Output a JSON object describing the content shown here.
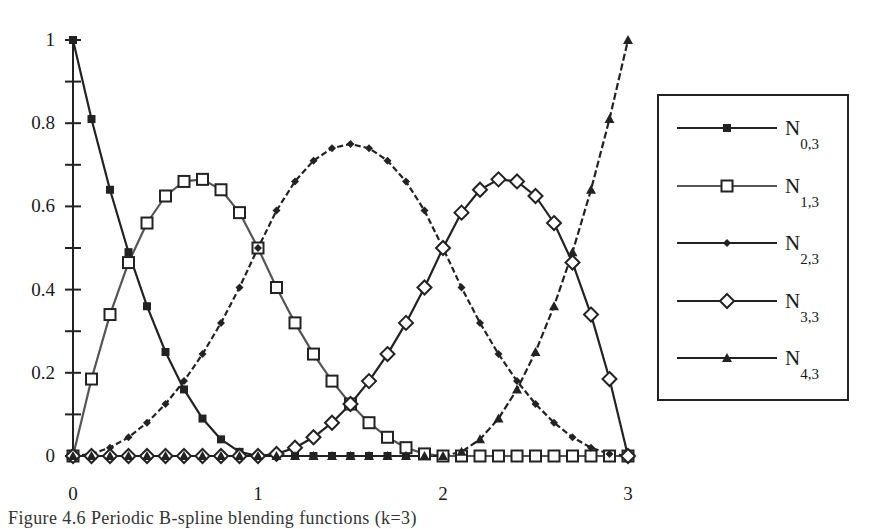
{
  "chart_data": {
    "type": "line",
    "title": "",
    "xlabel": "",
    "ylabel": "",
    "xlim": [
      0,
      3
    ],
    "ylim": [
      0,
      1
    ],
    "grid": false,
    "legend_position": "right",
    "x_ticks": [
      "0",
      "1",
      "2",
      "3"
    ],
    "y_ticks": [
      "0",
      "0.2",
      "0.4",
      "0.6",
      "0.8",
      "1"
    ],
    "y_minor_ticks": [
      0.1,
      0.3,
      0.5,
      0.7,
      0.9
    ],
    "x": [
      0,
      0.1,
      0.2,
      0.3,
      0.4,
      0.5,
      0.6,
      0.7,
      0.8,
      0.9,
      1.0,
      1.1,
      1.2,
      1.3,
      1.4,
      1.5,
      1.6,
      1.7,
      1.8,
      1.9,
      2.0,
      2.1,
      2.2,
      2.3,
      2.4,
      2.5,
      2.6,
      2.7,
      2.8,
      2.9,
      3.0
    ],
    "series": [
      {
        "name": "N0,3",
        "base": "N",
        "sub": "0,3",
        "marker": "filled-square",
        "line_color": "#222222",
        "dash": "none",
        "values": [
          1,
          0.81,
          0.64,
          0.49,
          0.36,
          0.25,
          0.16,
          0.09,
          0.04,
          0.01,
          0,
          0,
          0,
          0,
          0,
          0,
          0,
          0,
          0,
          0,
          0,
          0,
          0,
          0,
          0,
          0,
          0,
          0,
          0,
          0,
          0
        ]
      },
      {
        "name": "N1,3",
        "base": "N",
        "sub": "1,3",
        "marker": "open-square",
        "line_color": "#555555",
        "dash": "none",
        "values": [
          0,
          0.185,
          0.34,
          0.465,
          0.56,
          0.625,
          0.66,
          0.665,
          0.64,
          0.585,
          0.5,
          0.405,
          0.32,
          0.245,
          0.18,
          0.125,
          0.08,
          0.045,
          0.02,
          0.005,
          0,
          0,
          0,
          0,
          0,
          0,
          0,
          0,
          0,
          0,
          0
        ]
      },
      {
        "name": "N2,3",
        "base": "N",
        "sub": "2,3",
        "marker": "filled-diamond",
        "line_color": "#222222",
        "dash": "6,3",
        "values": [
          0,
          0.005,
          0.02,
          0.045,
          0.08,
          0.125,
          0.18,
          0.245,
          0.32,
          0.405,
          0.5,
          0.59,
          0.66,
          0.71,
          0.74,
          0.75,
          0.74,
          0.71,
          0.66,
          0.59,
          0.5,
          0.405,
          0.32,
          0.245,
          0.18,
          0.125,
          0.08,
          0.045,
          0.02,
          0.005,
          0
        ]
      },
      {
        "name": "N3,3",
        "base": "N",
        "sub": "3,3",
        "marker": "open-diamond",
        "line_color": "#222222",
        "dash": "none",
        "values": [
          0,
          0,
          0,
          0,
          0,
          0,
          0,
          0,
          0,
          0,
          0,
          0.005,
          0.02,
          0.045,
          0.08,
          0.125,
          0.18,
          0.245,
          0.32,
          0.405,
          0.5,
          0.585,
          0.64,
          0.665,
          0.66,
          0.625,
          0.56,
          0.465,
          0.34,
          0.185,
          0
        ]
      },
      {
        "name": "N4,3",
        "base": "N",
        "sub": "4,3",
        "marker": "filled-triangle",
        "line_color": "#222222",
        "dash": "7,3",
        "values": [
          0,
          0,
          0,
          0,
          0,
          0,
          0,
          0,
          0,
          0,
          0,
          0,
          0,
          0,
          0,
          0,
          0,
          0,
          0,
          0,
          0,
          0.01,
          0.04,
          0.09,
          0.16,
          0.25,
          0.36,
          0.49,
          0.64,
          0.81,
          1
        ]
      }
    ]
  },
  "caption": "Figure 4.6 Periodic B-spline blending functions (k=3)"
}
